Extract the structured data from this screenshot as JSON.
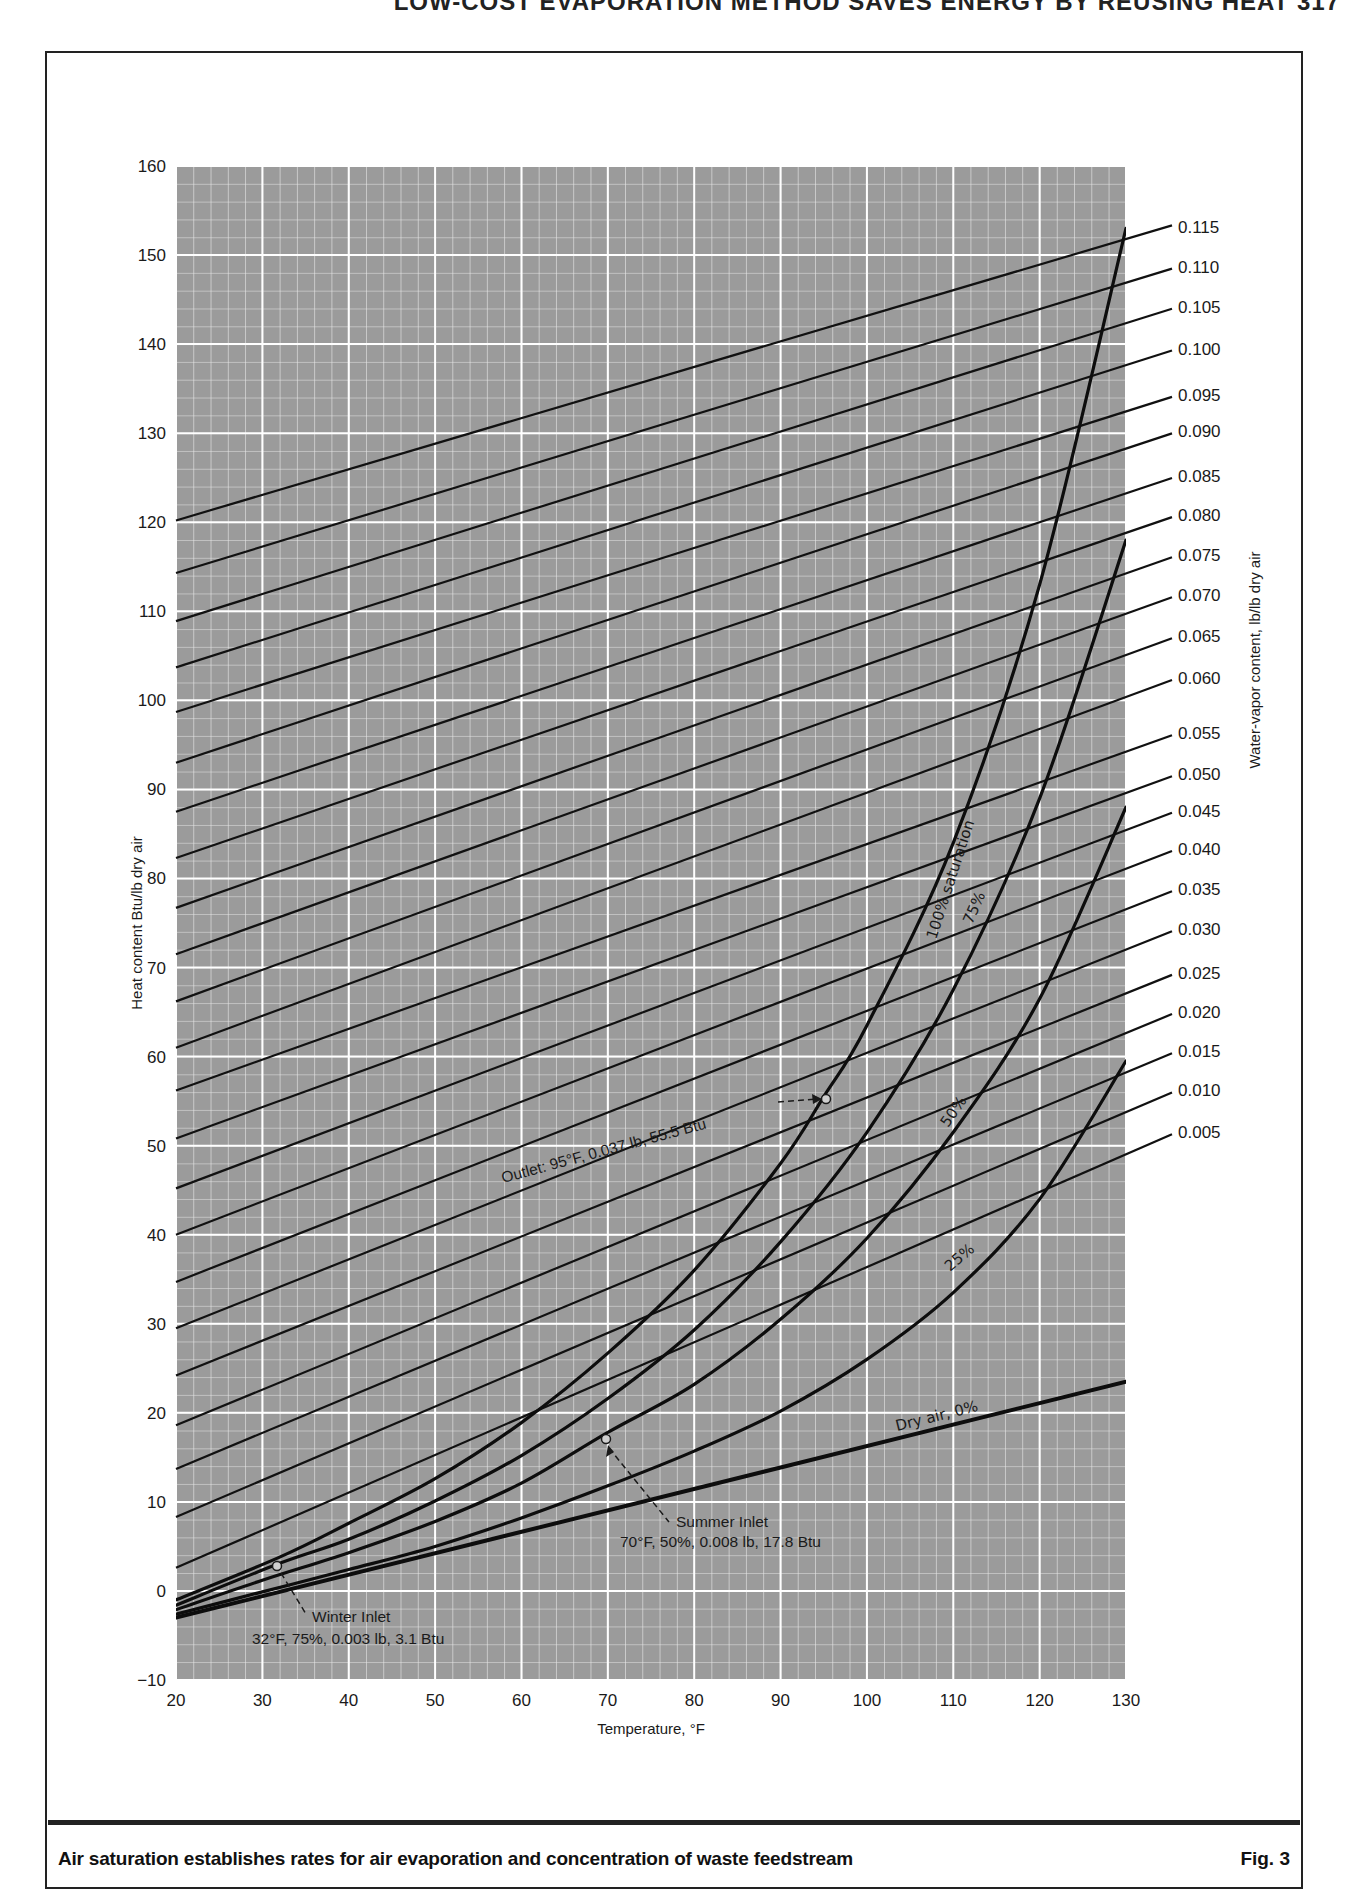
{
  "page": {
    "running_head": "LOW-COST EVAPORATION METHOD SAVES ENERGY BY REUSING HEAT   317",
    "caption": "Air saturation establishes rates for air evaporation and concentration of waste feedstream",
    "figure_label": "Fig. 3"
  },
  "chart_data": {
    "type": "line",
    "title": "",
    "xlabel": "Temperature, °F",
    "ylabel": "Heat content Btu/lb dry air",
    "y2label": "Water-vapor content, lb/lb dry air",
    "xlim": [
      20,
      130
    ],
    "ylim": [
      -10,
      160
    ],
    "x_ticks": [
      20,
      30,
      40,
      50,
      60,
      70,
      80,
      90,
      100,
      110,
      120,
      130
    ],
    "y_ticks": [
      -10,
      0,
      10,
      20,
      30,
      40,
      50,
      60,
      70,
      80,
      90,
      100,
      110,
      120,
      130,
      140,
      150,
      160
    ],
    "grid": {
      "on": true,
      "x_minor_step": 2,
      "y_minor_step": 2,
      "x_major_step": 10,
      "y_major_step": 10,
      "background": "#9a9a9a",
      "line_color": "#ffffff"
    },
    "saturation_curves": [
      {
        "name": "100% saturation",
        "label": "100% saturation",
        "x": [
          20,
          32,
          40,
          50,
          60,
          70,
          80,
          90,
          95,
          100,
          110,
          120,
          130
        ],
        "y": [
          -1.0,
          3.8,
          7.6,
          12.6,
          18.9,
          26.7,
          36.0,
          48.0,
          55.5,
          63.5,
          84.0,
          113.0,
          153.0
        ]
      },
      {
        "name": "75%",
        "label": "75%",
        "x": [
          20,
          32,
          40,
          50,
          60,
          70,
          80,
          90,
          100,
          110,
          120,
          130
        ],
        "y": [
          -1.6,
          3.1,
          5.8,
          10.1,
          15.2,
          21.6,
          29.3,
          39.2,
          51.5,
          67.5,
          89.0,
          118.0
        ]
      },
      {
        "name": "50%",
        "label": "50%",
        "x": [
          20,
          30,
          40,
          50,
          60,
          70,
          80,
          90,
          100,
          110,
          120,
          130
        ],
        "y": [
          -2.1,
          1.2,
          4.3,
          7.8,
          12.1,
          17.8,
          23.2,
          30.5,
          39.6,
          51.5,
          66.5,
          88.0
        ]
      },
      {
        "name": "25%",
        "label": "25%",
        "x": [
          20,
          30,
          40,
          50,
          60,
          70,
          80,
          90,
          100,
          110,
          120,
          130
        ],
        "y": [
          -2.6,
          -0.1,
          2.4,
          5.0,
          8.2,
          11.8,
          15.7,
          20.2,
          26.0,
          33.5,
          44.0,
          59.5
        ]
      },
      {
        "name": "Dry air, 0%",
        "label": "Dry air, 0%",
        "x": [
          20,
          130
        ],
        "y": [
          -3.0,
          23.5
        ]
      }
    ],
    "water_vapor_lines": {
      "unit": "lb/lb dry air",
      "labels": [
        "0.115",
        "0.110",
        "0.105",
        "0.100",
        "0.095",
        "0.090",
        "0.085",
        "0.080",
        "0.075",
        "0.070",
        "0.065",
        "0.060",
        "0.055",
        "0.050",
        "0.045",
        "0.040",
        "0.035",
        "0.030",
        "0.025",
        "0.020",
        "0.015",
        "0.010",
        "0.005"
      ],
      "y_at_20F": [
        120.2,
        114.3,
        108.9,
        103.7,
        98.7,
        93.0,
        87.5,
        82.3,
        76.7,
        71.5,
        66.2,
        61.0,
        56.2,
        50.8,
        45.2,
        40.0,
        34.7,
        29.5,
        24.2,
        18.6,
        13.7,
        8.3,
        2.6
      ],
      "y_at_130F": [
        151.8,
        146.7,
        141.8,
        136.5,
        131.5,
        126.9,
        122.0,
        117.5,
        112.4,
        107.9,
        103.0,
        98.0,
        93.3,
        88.0,
        84.2,
        79.7,
        75.2,
        70.1,
        65.7,
        61.1,
        56.8,
        52.2,
        47.5
      ],
      "label_y_values": [
        153.2,
        148.7,
        144.2,
        139.5,
        134.3,
        130.2,
        125.2,
        120.8,
        116.3,
        111.8,
        107.2,
        102.5,
        96.3,
        91.7,
        87.6,
        83.3,
        78.8,
        74.3,
        69.4,
        65.0,
        60.6,
        56.2,
        51.5
      ]
    },
    "annotations": [
      {
        "name": "outlet",
        "text": "Outlet: 95°F, 0.037 lb, 55.5 Btu",
        "x": 95,
        "y": 55.5
      },
      {
        "name": "summer-inlet",
        "title": "Summer Inlet",
        "text": "70°F, 50%, 0.008 lb, 17.8 Btu",
        "x": 70,
        "y": 17.8
      },
      {
        "name": "winter-inlet",
        "title": "Winter Inlet",
        "text": "32°F, 75%, 0.003 lb, 3.1 Btu",
        "x": 32,
        "y": 3.1
      }
    ]
  }
}
